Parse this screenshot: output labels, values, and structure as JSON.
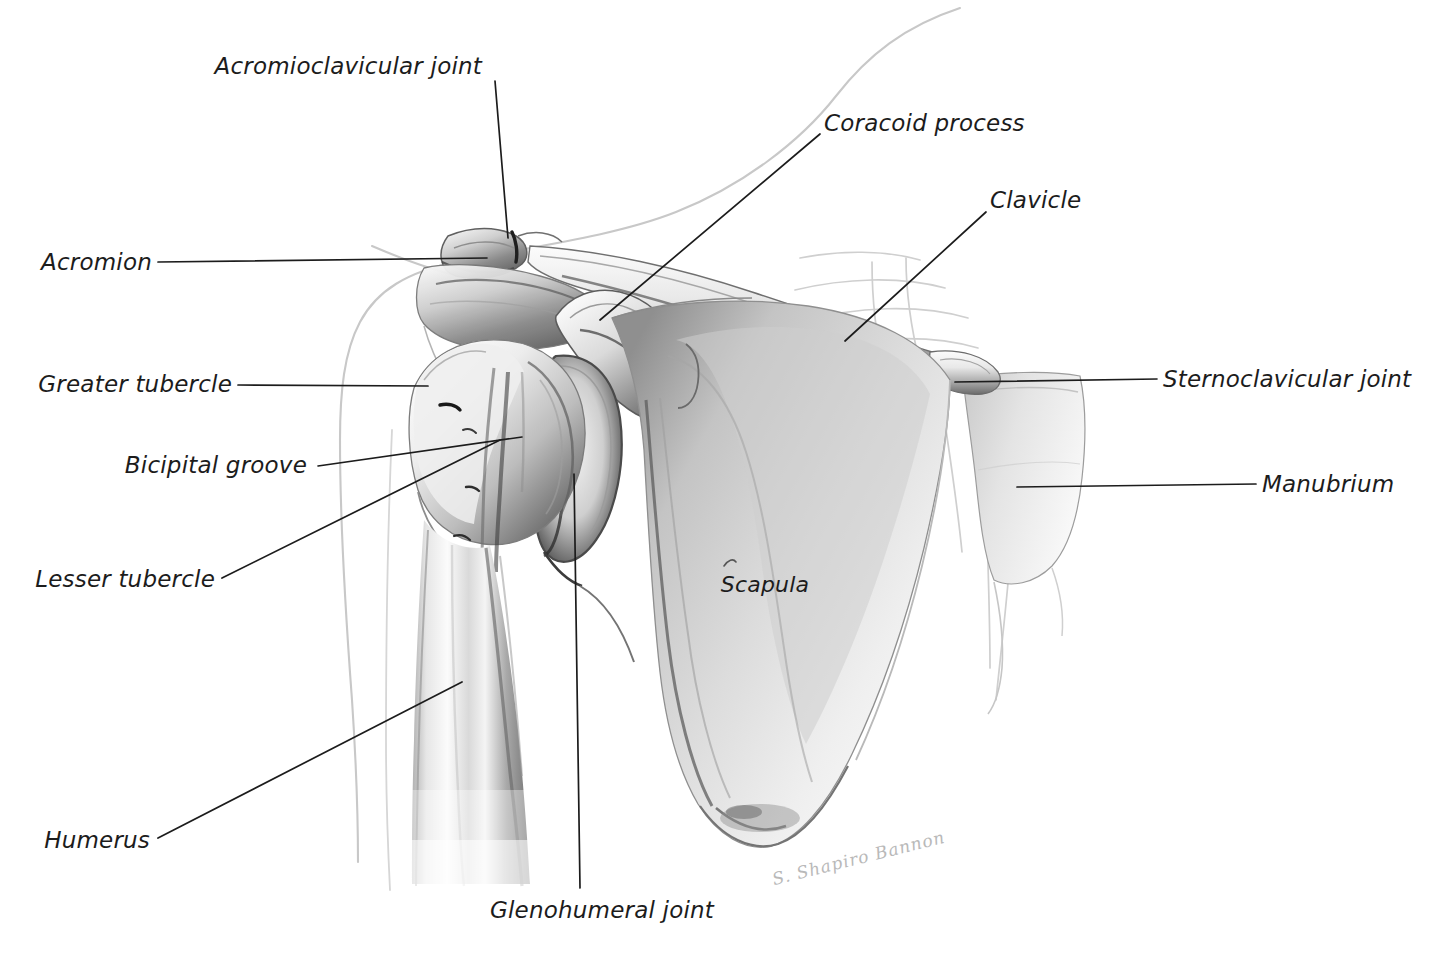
{
  "figure": {
    "type": "anatomical-illustration",
    "background_color": "#ffffff",
    "line_color": "#1c1c1c",
    "label_color": "#1c1c1c",
    "signature": "S. Shapiro Bannon"
  },
  "labels": [
    {
      "id": "acromioclavicular-joint",
      "text": "Acromioclavicular joint",
      "text_x": 482,
      "text_y": 66,
      "anchor": "right",
      "leader": {
        "x1": 495,
        "y1": 81,
        "x2": 508,
        "y2": 238
      }
    },
    {
      "id": "coracoid-process",
      "text": "Coracoid process",
      "text_x": 824,
      "text_y": 123,
      "anchor": "left",
      "leader": {
        "x1": 820,
        "y1": 134,
        "x2": 600,
        "y2": 320
      }
    },
    {
      "id": "clavicle",
      "text": "Clavicle",
      "text_x": 990,
      "text_y": 200,
      "anchor": "left",
      "leader": {
        "x1": 986,
        "y1": 212,
        "x2": 845,
        "y2": 341
      }
    },
    {
      "id": "acromion",
      "text": "Acromion",
      "text_x": 152,
      "text_y": 262,
      "anchor": "right",
      "leader": {
        "x1": 158,
        "y1": 262,
        "x2": 487,
        "y2": 258
      }
    },
    {
      "id": "sternoclavicular-joint",
      "text": "Sternoclavicular joint",
      "text_x": 1163,
      "text_y": 379,
      "anchor": "left",
      "leader": {
        "x1": 1157,
        "y1": 379,
        "x2": 955,
        "y2": 382
      }
    },
    {
      "id": "greater-tubercle",
      "text": "Greater tubercle",
      "text_x": 232,
      "text_y": 384,
      "anchor": "right",
      "leader": {
        "x1": 238,
        "y1": 385,
        "x2": 428,
        "y2": 386
      }
    },
    {
      "id": "bicipital-groove",
      "text": "Bicipital groove",
      "text_x": 307,
      "text_y": 465,
      "anchor": "right",
      "leader": {
        "x1": 318,
        "y1": 466,
        "x2": 522,
        "y2": 437
      }
    },
    {
      "id": "manubrium",
      "text": "Manubrium",
      "text_x": 1262,
      "text_y": 484,
      "anchor": "left",
      "leader": {
        "x1": 1256,
        "y1": 484,
        "x2": 1017,
        "y2": 487
      }
    },
    {
      "id": "lesser-tubercle",
      "text": "Lesser tubercle",
      "text_x": 215,
      "text_y": 579,
      "anchor": "right",
      "leader": {
        "x1": 222,
        "y1": 578,
        "x2": 500,
        "y2": 440
      }
    },
    {
      "id": "scapula",
      "text": "Scapula",
      "text_x": 765,
      "text_y": 585,
      "anchor": "center",
      "leader": null
    },
    {
      "id": "humerus",
      "text": "Humerus",
      "text_x": 150,
      "text_y": 840,
      "anchor": "right",
      "leader": {
        "x1": 158,
        "y1": 838,
        "x2": 462,
        "y2": 682
      }
    },
    {
      "id": "glenohumeral-joint",
      "text": "Glenohumeral joint",
      "text_x": 490,
      "text_y": 910,
      "anchor": "left",
      "leader": {
        "x1": 580,
        "y1": 888,
        "x2": 574,
        "y2": 474
      }
    }
  ],
  "structures": [
    {
      "id": "clavicle-bone",
      "name": "Clavicle"
    },
    {
      "id": "scapula-bone",
      "name": "Scapula"
    },
    {
      "id": "humerus-bone",
      "name": "Humerus"
    },
    {
      "id": "manubrium-bone",
      "name": "Manubrium"
    },
    {
      "id": "acromion-process",
      "name": "Acromion"
    },
    {
      "id": "coracoid-process-shape",
      "name": "Coracoid process"
    },
    {
      "id": "rib-cage-outline",
      "name": "Ribs"
    },
    {
      "id": "body-contour",
      "name": "Body surface contour"
    }
  ]
}
